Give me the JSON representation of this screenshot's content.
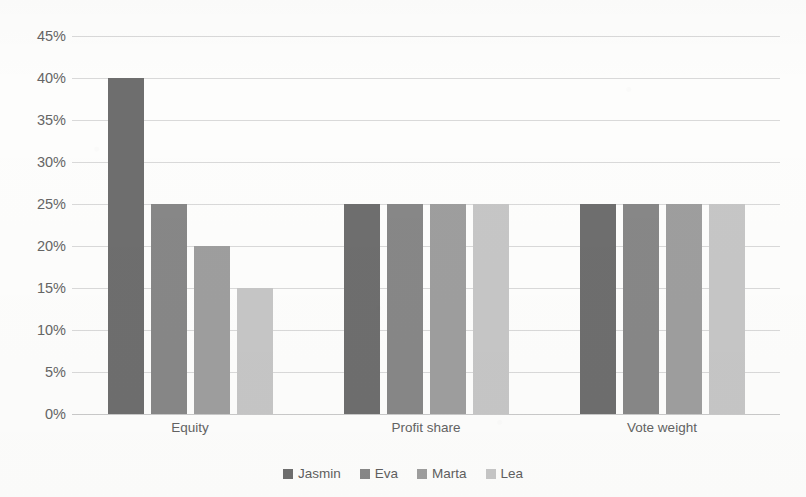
{
  "chart_data": {
    "type": "bar",
    "title": "",
    "title_note": "title row is cropped off the top edge of the screenshot and is not legible",
    "xlabel": "",
    "ylabel": "",
    "categories": [
      "Equity",
      "Profit share",
      "Vote weight"
    ],
    "series": [
      {
        "name": "Jasmin",
        "color": "#6e6e6e",
        "values": [
          40,
          25,
          25
        ]
      },
      {
        "name": "Eva",
        "color": "#878787",
        "values": [
          25,
          25,
          25
        ]
      },
      {
        "name": "Marta",
        "color": "#9e9e9e",
        "values": [
          20,
          25,
          25
        ]
      },
      {
        "name": "Lea",
        "color": "#c6c6c6",
        "values": [
          15,
          25,
          25
        ]
      }
    ],
    "value_unit": "%",
    "ylim": [
      0,
      45
    ],
    "ytick_step": 5,
    "ytick_labels": [
      "0%",
      "5%",
      "10%",
      "15%",
      "20%",
      "25%",
      "30%",
      "35%",
      "40%",
      "45%"
    ],
    "grid": "horizontal",
    "legend_position": "bottom-center",
    "gridline_color": "#d9d9d9",
    "background_color": "#fdfdfc",
    "text_color": "#636363"
  },
  "legend": {
    "entries": [
      {
        "label": "Jasmin",
        "color": "#6e6e6e"
      },
      {
        "label": "Eva",
        "color": "#878787"
      },
      {
        "label": "Marta",
        "color": "#9e9e9e"
      },
      {
        "label": "Lea",
        "color": "#c6c6c6"
      }
    ]
  }
}
